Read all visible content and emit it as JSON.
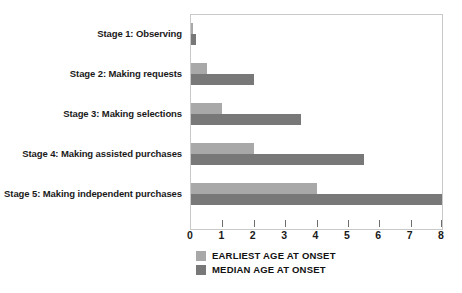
{
  "chart_data": {
    "type": "bar",
    "orientation": "horizontal",
    "title": "",
    "xlabel": "",
    "ylabel": "",
    "xlim": [
      0,
      8
    ],
    "xticks": [
      "0",
      "1",
      "2",
      "3",
      "4",
      "5",
      "6",
      "7",
      "8"
    ],
    "grid": false,
    "legend_position": "bottom-left",
    "categories": [
      "Stage 1: Observing",
      "Stage 2: Making requests",
      "Stage 3: Making selections",
      "Stage 4: Making assisted purchases",
      "Stage 5: Making independent purchases"
    ],
    "series": [
      {
        "name": "EARLIEST AGE AT ONSET",
        "color": "#a8a8a8",
        "values": [
          0.05,
          0.5,
          1,
          2,
          4
        ]
      },
      {
        "name": "MEDIAN AGE AT ONSET",
        "color": "#787878",
        "values": [
          0.15,
          2,
          3.5,
          5.5,
          8
        ]
      }
    ]
  },
  "legend": {
    "items": [
      {
        "label": "EARLIEST AGE AT ONSET",
        "swatch": "#a8a8a8"
      },
      {
        "label": "MEDIAN AGE AT ONSET",
        "swatch": "#787878"
      }
    ]
  },
  "colors": {
    "bar_light": "#a8a8a8",
    "bar_dark": "#787878",
    "plot_border": "#c9c9c9",
    "text": "#1a1a1a",
    "background": "#ffffff"
  }
}
